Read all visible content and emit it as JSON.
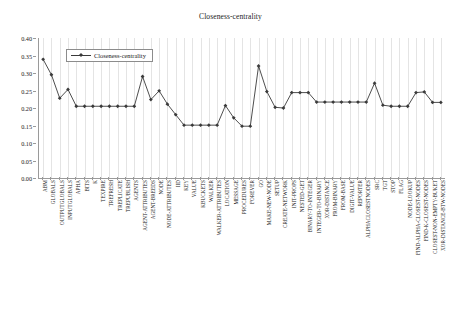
{
  "chart_data": {
    "type": "line",
    "title": "Closeness-centrality",
    "xlabel": "",
    "ylabel": "",
    "ylim": [
      0.0,
      0.4
    ],
    "ytick_labels": [
      "0.00",
      "0.05",
      "0.10",
      "0.15",
      "0.20",
      "0.25",
      "0.30",
      "0.35",
      "0.40"
    ],
    "ytick_values": [
      0.0,
      0.05,
      0.1,
      0.15,
      0.2,
      0.25,
      0.3,
      0.35,
      0.4
    ],
    "grid": "vertical",
    "legend_position": "top-left-inside",
    "legend_entries": [
      "Closeness-centrality"
    ],
    "marker": "diamond",
    "line_color": "#3a3a3a",
    "categories": [
      "ABM",
      "GLOBALS",
      "OUTPUTGLOBALS",
      "INPUTGLOBALS",
      "APHA",
      "BITS",
      "K",
      "TEXPIRE",
      "TREFRESH",
      "TREPLICATE",
      "TREPUBLISH",
      "AGENTS",
      "AGENT-ATTRIBUTES",
      "AGENT-BREEDS",
      "NODE",
      "NODE-ATTRIBUTES",
      "IID",
      "KEY",
      "VALUE",
      "KBUCKETS",
      "WALKER",
      "WALKER-ATTRIBUTES",
      "LOCATION",
      "MESSAGE",
      "PROCEDURES",
      "FOREVER",
      "GO",
      "MAKE-NEW-NODE",
      "SETUP",
      "CREATE-NETWORK",
      "INIT-PROPS",
      "NESTED-GET",
      "BINARY-TO-INTEGER",
      "INTEGER-TO-BINARY",
      "XOR-DISTANCE",
      "FROM-BINARY",
      "FROM-BASE",
      "DIGIT-VALUE",
      "REPORTER",
      "ALPHACLOSESTNODES",
      "SRC",
      "TGT",
      "STOP",
      "FLAG",
      "NODE-LOOKUP",
      "FIND-ALPHA-CLOSEST-NODES",
      "FIND-K-CLOSEST-NODES",
      "CLOSEST-NON-EMPTY-BUKET",
      "XOR-DISTANCE-BTW-NODES"
    ],
    "values": [
      0.339,
      0.295,
      0.228,
      0.253,
      0.205,
      0.205,
      0.205,
      0.205,
      0.205,
      0.205,
      0.205,
      0.205,
      0.29,
      0.224,
      0.249,
      0.211,
      0.181,
      0.151,
      0.151,
      0.151,
      0.151,
      0.151,
      0.207,
      0.172,
      0.148,
      0.148,
      0.32,
      0.247,
      0.202,
      0.2,
      0.244,
      0.244,
      0.244,
      0.217,
      0.217,
      0.217,
      0.217,
      0.217,
      0.217,
      0.217,
      0.271,
      0.208,
      0.205,
      0.205,
      0.205,
      0.244,
      0.246,
      0.216,
      0.216
    ]
  }
}
